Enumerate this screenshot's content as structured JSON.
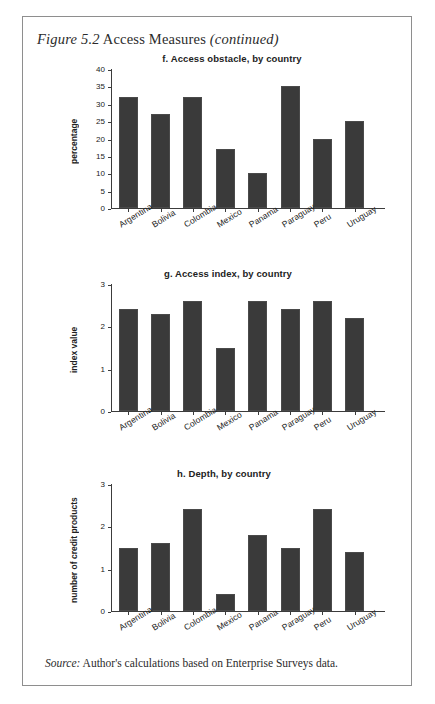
{
  "figure": {
    "title_main": "Figure 5.2",
    "title_rest": "Access Measures",
    "title_continued": "(continued)",
    "source_label": "Source:",
    "source_text": "Author's calculations based on Enterprise Surveys data."
  },
  "colors": {
    "bar": "#3a3a3a",
    "axis": "#3c3c3c",
    "frame": "#8e8e8e",
    "text": "#222222"
  },
  "chart_data": [
    {
      "id": "f",
      "type": "bar",
      "title": "f. Access obstacle, by country",
      "xlabel": "",
      "ylabel": "percentage",
      "categories": [
        "Argentina",
        "Bolivia",
        "Colombia",
        "Mexico",
        "Panama",
        "Paraguay",
        "Peru",
        "Uruguay"
      ],
      "values": [
        32,
        27,
        32,
        17,
        10,
        35,
        20,
        25
      ],
      "yticks": [
        0,
        5,
        10,
        15,
        20,
        25,
        30,
        35,
        40
      ],
      "ylim": [
        0,
        40
      ],
      "grid": false,
      "legend": "none"
    },
    {
      "id": "g",
      "type": "bar",
      "title": "g. Access index, by country",
      "xlabel": "",
      "ylabel": "index value",
      "categories": [
        "Argentina",
        "Bolivia",
        "Colombia",
        "Mexico",
        "Panama",
        "Paraguay",
        "Peru",
        "Uruguay"
      ],
      "values": [
        2.4,
        2.3,
        2.6,
        1.5,
        2.6,
        2.4,
        2.6,
        2.2
      ],
      "yticks": [
        0,
        1,
        2,
        3
      ],
      "ylim": [
        0,
        3
      ],
      "grid": false,
      "legend": "none"
    },
    {
      "id": "h",
      "type": "bar",
      "title": "h. Depth, by country",
      "xlabel": "",
      "ylabel": "number of credit products",
      "categories": [
        "Argentina",
        "Bolivia",
        "Colombia",
        "Mexico",
        "Panama",
        "Paraguay",
        "Peru",
        "Uruguay"
      ],
      "values": [
        1.5,
        1.6,
        2.4,
        0.4,
        1.8,
        1.5,
        2.4,
        1.4
      ],
      "yticks": [
        0,
        1,
        2,
        3
      ],
      "ylim": [
        0,
        3
      ],
      "grid": false,
      "legend": "none"
    }
  ]
}
